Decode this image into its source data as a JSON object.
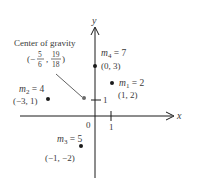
{
  "diagram": {
    "axes": {
      "x_label": "x",
      "y_label": "y",
      "origin_label": "0",
      "x_tick_label": "1",
      "y_tick_label": "1"
    },
    "center_of_gravity": {
      "title": "Center of gravity",
      "open": "(−",
      "x_num": "5",
      "x_den": "6",
      "comma": ",",
      "y_num": "19",
      "y_den": "18",
      "close": ")",
      "x": -0.8333,
      "y": 1.0556
    },
    "masses": [
      {
        "name": "m",
        "sub": "1",
        "eq": " = 2",
        "coords": "(1, 2)",
        "x": 1,
        "y": 2,
        "mass": 2
      },
      {
        "name": "m",
        "sub": "2",
        "eq": " = 4",
        "coords": "(−3, 1)",
        "x": -3,
        "y": 1,
        "mass": 4
      },
      {
        "name": "m",
        "sub": "3",
        "eq": " = 5",
        "coords": "(−1, −2)",
        "x": -1,
        "y": -2,
        "mass": 5
      },
      {
        "name": "m",
        "sub": "4",
        "eq": " = 7",
        "coords": "(0, 3)",
        "x": 0,
        "y": 3,
        "mass": 7
      }
    ],
    "colors": {
      "ink": "#1a1a1a",
      "text": "#3a3a3a",
      "center_dot": "#6a6a6a"
    }
  }
}
